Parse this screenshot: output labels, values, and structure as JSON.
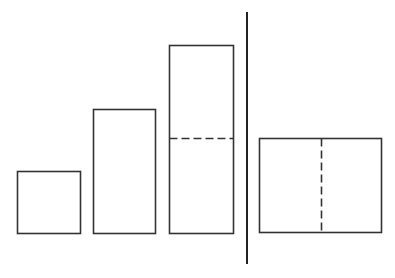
{
  "diagram": {
    "stroke_color": "#333333",
    "background": "#ffffff",
    "left_group": [
      {
        "name": "small-square",
        "x": 17,
        "y": 171,
        "w": 63,
        "h": 62,
        "dashed_divider": null
      },
      {
        "name": "medium-rect",
        "x": 93,
        "y": 109,
        "w": 62,
        "h": 124,
        "dashed_divider": null
      },
      {
        "name": "tall-rect",
        "x": 169,
        "y": 45,
        "w": 64,
        "h": 188,
        "dashed_divider": {
          "orientation": "horizontal",
          "at": 138
        }
      }
    ],
    "divider": {
      "x": 246,
      "y1": 12,
      "y2": 264,
      "width": 2
    },
    "right_group": [
      {
        "name": "wide-rect",
        "x": 259,
        "y": 138,
        "w": 122,
        "h": 94,
        "dashed_divider": {
          "orientation": "vertical",
          "at": 321
        }
      }
    ]
  }
}
